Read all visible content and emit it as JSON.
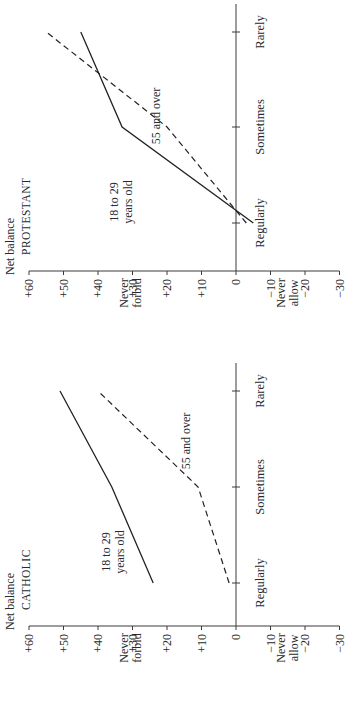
{
  "chart_data": [
    {
      "type": "line",
      "title": "CATHOLIC",
      "ylabel": "Net balance",
      "ylabel_top": "Never forbid",
      "ylabel_bottom": "Never allow",
      "categories": [
        "Regularly",
        "Sometimes",
        "Rarely"
      ],
      "yticks": [
        "+60",
        "+50",
        "+40",
        "+30",
        "+20",
        "+10",
        "0",
        "−10",
        "−20",
        "−30"
      ],
      "ylim": [
        -30,
        60
      ],
      "series": [
        {
          "name": "18 to 29 years old",
          "style": "solid",
          "values": [
            24,
            36,
            51
          ]
        },
        {
          "name": "55 and over",
          "style": "dashed",
          "values": [
            2,
            11,
            40
          ]
        }
      ],
      "annotations": [
        "18 to 29 years old",
        "55 and over"
      ],
      "grid": false,
      "orientation": "rotated 90° counter-clockwise"
    },
    {
      "type": "line",
      "title": "PROTESTANT",
      "ylabel": "Net balance",
      "ylabel_top": "Never forbid",
      "ylabel_bottom": "Never allow",
      "categories": [
        "Regularly",
        "Sometimes",
        "Rarely"
      ],
      "yticks": [
        "+60",
        "+50",
        "+40",
        "+30",
        "+20",
        "+10",
        "0",
        "−10",
        "−20",
        "−30"
      ],
      "ylim": [
        -30,
        60
      ],
      "series": [
        {
          "name": "18 to 29 years old",
          "style": "solid",
          "values": [
            -5,
            33,
            45
          ]
        },
        {
          "name": "55 and over",
          "style": "dashed",
          "values": [
            -3,
            20,
            55
          ]
        }
      ],
      "annotations": [
        "18 to 29 years old",
        "55 and over"
      ],
      "grid": false,
      "orientation": "rotated 90° counter-clockwise"
    }
  ],
  "labels": {
    "net_balance": "Net balance",
    "never": "Never",
    "forbid": "forbid",
    "allow": "allow",
    "young_line1": "18 to 29",
    "young_line2": "years old",
    "old": "55 and over"
  }
}
